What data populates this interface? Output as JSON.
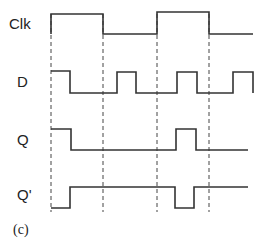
{
  "diagram": {
    "caption": "(c)",
    "colors": {
      "line": "#333333",
      "dashed": "#444444",
      "text": "#222222"
    },
    "clock_edges_x": [
      51,
      103,
      157,
      209
    ],
    "dashed_y": [
      14,
      212
    ],
    "signals": [
      {
        "name": "Clk",
        "label_x": 9,
        "label_y": 15,
        "points": "51,34 51,14 103,14 103,34 157,34 157,12 209,12 209,34 253,34"
      },
      {
        "name": "D",
        "label_x": 17,
        "label_y": 73,
        "points": "51,71 70,71 70,93 117,93 117,72 136,72 136,93 177,93 177,72 197,72 197,93 233,93 233,72 253,72 253,93"
      },
      {
        "name": "Q",
        "label_x": 17,
        "label_y": 131,
        "points": "51,129 71,129 71,150 176,150 176,129 196,129 196,150 248,150"
      },
      {
        "name": "Q'",
        "label_x": 17,
        "label_y": 186,
        "points": "51,208 70,208 70,187 175,187 175,208 194,208 194,187 248,187"
      }
    ]
  }
}
